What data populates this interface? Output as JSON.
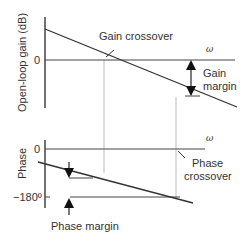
{
  "diagram": {
    "type": "bode-plot-stability-margins",
    "gain_plot": {
      "ylabel": "Open-loop gain (dB)",
      "zero_tick": "0",
      "x_axis_label": "ω",
      "annotations": {
        "gain_crossover": "Gain crossover",
        "gain_margin_line1": "Gain",
        "gain_margin_line2": "margin"
      }
    },
    "phase_plot": {
      "ylabel": "Phase",
      "zero_tick": "0",
      "minus180_tick": "−180º",
      "x_axis_label": "ω",
      "annotations": {
        "phase_crossover_line1": "Phase",
        "phase_crossover_line2": "crossover",
        "phase_margin": "Phase margin"
      }
    },
    "colors": {
      "line": "#333333",
      "guide": "#bbbbbb",
      "text": "#333333"
    }
  }
}
